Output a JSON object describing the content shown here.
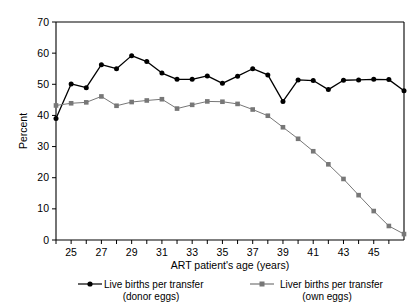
{
  "chart_data": {
    "type": "line",
    "title": "",
    "xlabel": "ART patient's age (years)",
    "ylabel": "Percent",
    "xlim": [
      24,
      47
    ],
    "ylim": [
      0,
      70
    ],
    "xticks": [
      25,
      27,
      29,
      31,
      33,
      35,
      37,
      39,
      41,
      43,
      45
    ],
    "xtick_labels": [
      "25",
      "27",
      "29",
      "31",
      "33",
      "35",
      "37",
      "39",
      "41",
      "43",
      "45"
    ],
    "x_minor_ticks": [
      24,
      26,
      28,
      30,
      32,
      34,
      36,
      38,
      40,
      42,
      44,
      46
    ],
    "yticks": [
      0,
      10,
      20,
      30,
      40,
      50,
      60,
      70
    ],
    "ytick_labels": [
      "0",
      "10",
      "20",
      "30",
      "40",
      "50",
      "60",
      "70"
    ],
    "grid": false,
    "legend_position": "below",
    "x": [
      24,
      25,
      26,
      27,
      28,
      29,
      30,
      31,
      32,
      33,
      34,
      35,
      36,
      37,
      38,
      39,
      40,
      41,
      42,
      43,
      44,
      45,
      46,
      47
    ],
    "series": [
      {
        "name": "Live births per transfer (donor eggs)",
        "color": "#000000",
        "marker": "circle",
        "values": [
          39.0,
          50.1,
          48.9,
          56.3,
          55.0,
          59.2,
          57.3,
          53.6,
          51.6,
          51.6,
          52.7,
          50.3,
          52.6,
          55.0,
          53.0,
          44.5,
          51.4,
          51.2,
          48.3,
          51.3,
          51.4,
          51.6,
          51.5,
          47.9
        ]
      },
      {
        "name": "Liver births per transfer (own eggs)",
        "color": "#777777",
        "marker": "square",
        "values": [
          43.2,
          43.9,
          44.2,
          46.1,
          43.1,
          44.3,
          44.8,
          45.2,
          42.2,
          43.4,
          44.5,
          44.4,
          43.7,
          41.9,
          39.9,
          36.2,
          32.5,
          28.5,
          24.3,
          19.6,
          14.4,
          9.3,
          4.5,
          1.9
        ]
      }
    ]
  },
  "legend": {
    "entries": [
      {
        "line1": "Live births per transfer",
        "line2": "(donor eggs)",
        "marker": "circle-marker",
        "color": "#000000"
      },
      {
        "line1": "Liver births per transfer",
        "line2": "(own eggs)",
        "marker": "square-marker",
        "color": "#777777"
      }
    ]
  }
}
